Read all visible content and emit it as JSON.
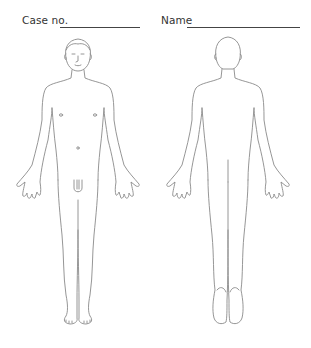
{
  "form": {
    "case_label": "Case no.",
    "name_label": "Name",
    "case_value": "",
    "name_value": ""
  },
  "figures": {
    "front": {
      "label": "anterior body view"
    },
    "back": {
      "label": "posterior body view"
    }
  },
  "colors": {
    "outline": "#8a8a8a",
    "text": "#333333",
    "background": "#ffffff"
  }
}
